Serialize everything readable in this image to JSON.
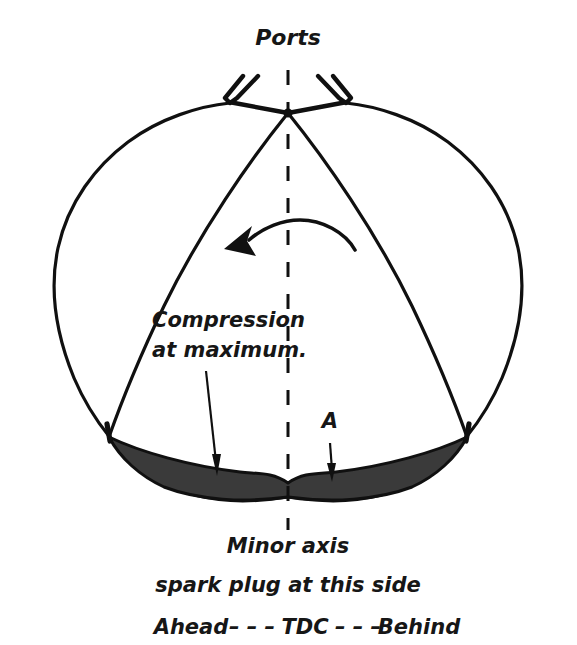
{
  "figure": {
    "title": "Ports",
    "background_color": "#ffffff",
    "line_color": "#101010",
    "chamber_fill_color": "#3a3a3a"
  },
  "labels": {
    "ports": "Ports",
    "compression_line1": "Compression",
    "compression_line2": "at maximum.",
    "point_a": "A"
  },
  "caption": {
    "line1": "Minor axis",
    "line2": "spark plug at this side",
    "line3_left": "Ahead",
    "line3_dash_left": "– – –",
    "line3_center": "TDC",
    "line3_dash_right": "– – –",
    "line3_right": "Behind",
    "line3_full": "Ahead– – – TDC – – – Behind"
  },
  "annotations": {
    "rotation_direction": "counter-clockwise",
    "centerline": "minor axis vertical dashed line",
    "chamber": "compression chamber at maximum compression"
  }
}
